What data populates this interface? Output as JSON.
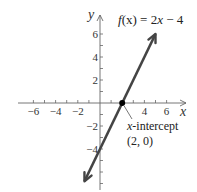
{
  "chart_data": {
    "type": "line",
    "title": "",
    "function_label": {
      "prefix": "f",
      "arg": "(x)",
      "eq": " = 2",
      "var": "x",
      "rest": " − 4"
    },
    "function": "f(x) = 2x - 4",
    "slope": 2,
    "intercept": -4,
    "xlabel": "x",
    "ylabel": "y",
    "xlim": [
      -7,
      7.5
    ],
    "ylim": [
      -7.5,
      7
    ],
    "x_ticks": [
      -6,
      -5,
      -4,
      -3,
      -2,
      -1,
      1,
      2,
      3,
      4,
      5,
      6
    ],
    "x_tick_labels": [
      {
        "value": -6,
        "text": "−6"
      },
      {
        "value": -4,
        "text": "−4"
      },
      {
        "value": -2,
        "text": "−2"
      },
      {
        "value": 4,
        "text": "4"
      },
      {
        "value": 6,
        "text": "6"
      }
    ],
    "y_ticks": [
      -7,
      -6,
      -5,
      -4,
      -3,
      -2,
      -1,
      1,
      2,
      3,
      4,
      5,
      6
    ],
    "y_tick_labels": [
      {
        "value": 6,
        "text": "6"
      },
      {
        "value": 4,
        "text": "4"
      },
      {
        "value": 2,
        "text": "2"
      },
      {
        "value": -2,
        "text": "−2"
      },
      {
        "value": -4,
        "text": "−4"
      }
    ],
    "line_segment": {
      "x1": -1.4,
      "y1": -6.8,
      "x2": 5.0,
      "y2": 6.0
    },
    "points": [
      {
        "x": 2,
        "y": 0,
        "label": "x-intercept"
      }
    ],
    "annotation": {
      "line1_var": "x",
      "line1_rest": "-intercept",
      "line2": "(2, 0)"
    },
    "grid": false,
    "legend": "none",
    "line_color": "#444444"
  }
}
